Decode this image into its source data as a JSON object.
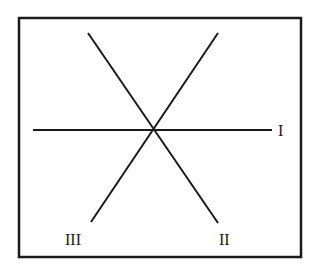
{
  "diagram": {
    "type": "three intersecting lines in a framed box",
    "lines": [
      {
        "label": "I",
        "x1": 33,
        "y1": 130,
        "x2": 272,
        "y2": 130
      },
      {
        "label": "II",
        "x1": 88,
        "y1": 33,
        "x2": 218,
        "y2": 223
      },
      {
        "label": "III",
        "x1": 218,
        "y1": 33,
        "x2": 91,
        "y2": 222
      }
    ],
    "labels": {
      "I": "I",
      "II": "II",
      "III": "III"
    },
    "colors": {
      "line": "#1a1a1a",
      "frame": "#1a1a1a",
      "background": "#ffffff"
    }
  }
}
